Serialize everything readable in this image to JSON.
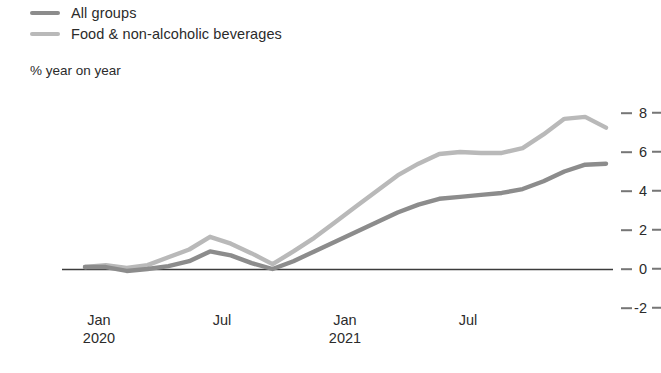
{
  "legend": {
    "items": [
      {
        "label": "All groups",
        "color": "#8c8c8c",
        "key": "all_groups"
      },
      {
        "label": "Food & non-alcoholic beverages",
        "color": "#b9b9b9",
        "key": "food_non_alcoholic"
      }
    ]
  },
  "axis": {
    "y_title": "% year on year",
    "y_ticks": [
      "8",
      "6",
      "4",
      "2",
      "0",
      "-2"
    ],
    "x_ticks": [
      {
        "month": "Jan",
        "year": "2020"
      },
      {
        "month": "Jul",
        "year": ""
      },
      {
        "month": "Jan",
        "year": "2021"
      },
      {
        "month": "Jul",
        "year": ""
      }
    ]
  },
  "colors": {
    "all_groups": "#8c8c8c",
    "food_non_alcoholic": "#b9b9b9",
    "zero_line": "#3c3c3c",
    "tick": "#767676",
    "text": "#2b2b2b"
  },
  "chart_data": {
    "type": "line",
    "title": "",
    "subtitle": "",
    "xlabel": "",
    "ylabel": "% year on year",
    "ylim": [
      -2,
      8
    ],
    "yticks": [
      -2,
      0,
      2,
      4,
      6,
      8
    ],
    "grid": false,
    "legend_position": "top-left",
    "x": [
      "Jan 2020",
      "Feb 2020",
      "Mar 2020",
      "Apr 2020",
      "May 2020",
      "Jun 2020",
      "Jul 2020",
      "Aug 2020",
      "Sep 2020",
      "Oct 2020",
      "Nov 2020",
      "Dec 2020",
      "Jan 2021",
      "Feb 2021",
      "Mar 2021",
      "Apr 2021",
      "May 2021",
      "Jun 2021",
      "Jul 2021",
      "Aug 2021",
      "Sep 2021",
      "Oct 2021",
      "Nov 2021",
      "Dec 2021",
      "Jan 2022",
      "Feb 2022"
    ],
    "xtick_labels": [
      "Jan 2020",
      "Jul",
      "Jan 2021",
      "Jul"
    ],
    "xtick_indices": [
      0,
      6,
      12,
      18
    ],
    "series": [
      {
        "name": "All groups",
        "color": "#8c8c8c",
        "values": [
          0.1,
          0.1,
          -0.1,
          0.0,
          0.15,
          0.4,
          0.9,
          0.7,
          0.3,
          0.0,
          0.4,
          0.9,
          1.4,
          1.9,
          2.4,
          2.9,
          3.3,
          3.6,
          3.7,
          3.8,
          3.9,
          4.1,
          4.5,
          5.0,
          5.35,
          5.4
        ]
      },
      {
        "name": "Food & non-alcoholic beverages",
        "color": "#b9b9b9",
        "values": [
          0.1,
          0.2,
          0.05,
          0.2,
          0.6,
          1.0,
          1.65,
          1.3,
          0.8,
          0.25,
          0.9,
          1.6,
          2.4,
          3.2,
          4.0,
          4.8,
          5.4,
          5.9,
          6.0,
          5.95,
          5.95,
          6.2,
          6.9,
          7.7,
          7.8,
          7.25
        ]
      }
    ]
  }
}
